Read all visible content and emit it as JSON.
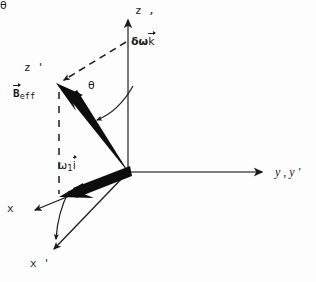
{
  "diagram": {
    "background_color": "#fdfdfd",
    "ink_color": "#1a1a1a",
    "width": 316,
    "height": 282,
    "origin": {
      "x": 128,
      "y": 172
    },
    "axes": [
      {
        "id": "z",
        "label": "z ,",
        "description": "vertical laboratory z axis, coincident with z of rotating frame",
        "from": {
          "x": 128,
          "y": 172
        },
        "to": {
          "x": 128,
          "y": 14
        },
        "style": "solid-thin",
        "arrow": true
      },
      {
        "id": "y",
        "label": "y , y '",
        "description": "horizontal y axis, coincident with y' of rotating frame",
        "from": {
          "x": 128,
          "y": 172
        },
        "to": {
          "x": 268,
          "y": 172
        },
        "style": "solid-thin",
        "arrow": true
      },
      {
        "id": "x",
        "label": "x",
        "description": "x axis of laboratory frame projected to lower left",
        "from": {
          "x": 128,
          "y": 172
        },
        "to": {
          "x": 30,
          "y": 212
        },
        "style": "solid-thin",
        "arrow": true
      },
      {
        "id": "x-prime",
        "label": "x '",
        "description": "x' axis of the tilted rotating frame",
        "from": {
          "x": 128,
          "y": 172
        },
        "to": {
          "x": 51,
          "y": 253
        },
        "style": "solid-thin",
        "arrow": true
      },
      {
        "id": "z-prime",
        "label": "z '",
        "description": "z' axis of the tilted rotating frame, along B_eff",
        "from": {
          "x": 128,
          "y": 172
        },
        "to": {
          "x": 57,
          "y": 84
        },
        "style": "thick-vector",
        "arrow": true
      }
    ],
    "vectors": [
      {
        "id": "b-eff",
        "label_base": "B",
        "label_subscript": "eff",
        "label_has_overarrow": true,
        "label_text": "B⃗_eff",
        "description": "Effective field vector, thick black arrow pointing up-left along z'",
        "from": {
          "x": 128,
          "y": 172
        },
        "to": {
          "x": 57,
          "y": 84
        },
        "style": "thick-vector"
      },
      {
        "id": "omega1-i",
        "label_base": "ω",
        "label_subscript": "1",
        "label_unit_vector": "i",
        "label_has_overarrow": true,
        "label_text": "ω₁ i⃗",
        "description": "RF field component omega-1 along the x (i) direction, thick black arrow to lower left",
        "from": {
          "x": 128,
          "y": 172
        },
        "to": {
          "x": 60,
          "y": 197
        },
        "style": "thick-vector"
      },
      {
        "id": "delta-omega-k",
        "label_base": "δω",
        "label_unit_vector": "k",
        "label_has_overarrow": true,
        "label_text": "δω k⃗",
        "description": "Resonance offset component along the z (k) direction, measured up the z axis",
        "from": {
          "x": 128,
          "y": 172
        },
        "to": {
          "x": 128,
          "y": 46
        },
        "style": "along-z-axis"
      }
    ],
    "construction_lines": [
      {
        "id": "dashed-offset-to-beff",
        "description": "dashed line from tip of delta-omega k on the z axis to the tip of B_eff",
        "from": {
          "x": 126,
          "y": 42
        },
        "to": {
          "x": 60,
          "y": 82
        },
        "style": "dashed"
      },
      {
        "id": "dashed-beff-vertical-drop",
        "description": "dashed vertical line from tip of B_eff down to the tip of omega-1 i",
        "from": {
          "x": 59,
          "y": 90
        },
        "to": {
          "x": 59,
          "y": 197
        },
        "style": "dashed"
      }
    ],
    "angles": [
      {
        "id": "theta-upper",
        "label": "θ",
        "description": "tilt angle between the z axis and B_eff (z' axis)",
        "label_pos": {
          "x": 88,
          "y": 80
        },
        "arc_from": {
          "x": 136,
          "y": 84
        },
        "arc_to": {
          "x": 88,
          "y": 118
        }
      },
      {
        "id": "theta-lower",
        "label": "θ",
        "description": "tilt angle between the x axis and the x' axis",
        "label_pos": {
          "x": 40,
          "y": 219
        },
        "arc_from": {
          "x": 70,
          "y": 190
        },
        "arc_to": {
          "x": 55,
          "y": 244
        }
      }
    ],
    "labels": {
      "z_axis": "z ,",
      "z_prime": "z '",
      "y_axis": "y , y '",
      "x_axis": "x",
      "x_prime": "x '",
      "theta_upper": "θ",
      "theta_lower": "θ",
      "delta_omega_base": "δω",
      "delta_omega_unit": "k",
      "beff_base": "B",
      "beff_subscript": "eff",
      "omega1_base": "ω",
      "omega1_subscript": "1",
      "omega1_unit": "i"
    }
  }
}
